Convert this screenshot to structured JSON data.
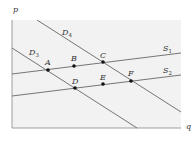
{
  "diagram": {
    "axes": {
      "y_label": "p",
      "x_label": "q"
    },
    "lines": [
      {
        "id": "D4",
        "name": "D",
        "sub": "4",
        "x1": 37,
        "y1": 20,
        "x2": 181,
        "y2": 112,
        "lx": 62,
        "ly": 35
      },
      {
        "id": "D3",
        "name": "D",
        "sub": "3",
        "x1": 12,
        "y1": 48,
        "x2": 137,
        "y2": 128,
        "lx": 29,
        "ly": 55
      },
      {
        "id": "S1",
        "name": "S",
        "sub": "1",
        "x1": 12,
        "y1": 74,
        "x2": 181,
        "y2": 53,
        "lx": 163,
        "ly": 51
      },
      {
        "id": "S2",
        "name": "S",
        "sub": "2",
        "x1": 12,
        "y1": 96,
        "x2": 181,
        "y2": 75,
        "lx": 163,
        "ly": 73
      }
    ],
    "points": [
      {
        "label": "A",
        "x": 48,
        "y": 70,
        "lx": 45,
        "ly": 65
      },
      {
        "label": "B",
        "x": 74,
        "y": 66,
        "lx": 71,
        "ly": 61
      },
      {
        "label": "C",
        "x": 103,
        "y": 62,
        "lx": 100,
        "ly": 58
      },
      {
        "label": "D",
        "x": 75,
        "y": 88,
        "lx": 72,
        "ly": 84
      },
      {
        "label": "E",
        "x": 103,
        "y": 84,
        "lx": 100,
        "ly": 80
      },
      {
        "label": "F",
        "x": 131,
        "y": 81,
        "lx": 128,
        "ly": 76
      }
    ],
    "colors": {
      "plot_bg": "#f2f2f2",
      "line": "#666666",
      "point": "#111111",
      "axis": "#444444"
    }
  }
}
